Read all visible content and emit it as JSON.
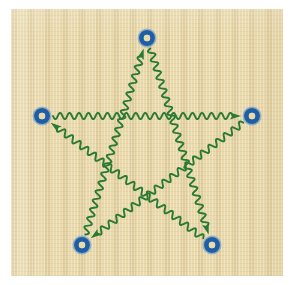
{
  "figure": {
    "panel": {
      "x": 11,
      "y": 9,
      "width": 272,
      "height": 267,
      "background_color": "#e9d9ab",
      "texture": "woven-paper"
    },
    "canvas": {
      "width": 293,
      "height": 285,
      "background_color": "#ffffff"
    }
  },
  "style": {
    "edge_color": "#2a7a33",
    "edge_width": 1.9,
    "node_ring_color": "#1d5ea6",
    "node_ring_highlight": "#4f90cf",
    "node_center_color": "#e9d9ab",
    "node_outer_radius": 8.0,
    "node_inner_radius": 3.2,
    "wave_amplitude": 3.2,
    "wave_period": 9.5,
    "arrow_length": 11,
    "arrow_width": 7
  },
  "nodes": [
    {
      "id": "top",
      "label": "top node",
      "x": 147,
      "y": 38
    },
    {
      "id": "right",
      "label": "right node",
      "x": 252,
      "y": 116
    },
    {
      "id": "bottom-right",
      "label": "bottom right node",
      "x": 212,
      "y": 245
    },
    {
      "id": "bottom-left",
      "label": "bottom left node",
      "x": 82,
      "y": 245
    },
    {
      "id": "left",
      "label": "left node",
      "x": 42,
      "y": 116
    }
  ],
  "edges": [
    {
      "id": "e1",
      "label": "left to right",
      "from": "left",
      "to": "right",
      "arrow_at": "to"
    },
    {
      "id": "e2",
      "label": "right to bottom-left",
      "from": "right",
      "to": "bottom-left",
      "arrow_at": "to"
    },
    {
      "id": "e3",
      "label": "bottom-left to top",
      "from": "bottom-left",
      "to": "top",
      "arrow_at": "to"
    },
    {
      "id": "e4",
      "label": "top to bottom-right",
      "from": "top",
      "to": "bottom-right",
      "arrow_at": "to"
    },
    {
      "id": "e5",
      "label": "bottom-right to left",
      "from": "bottom-right",
      "to": "left",
      "arrow_at": "to"
    }
  ]
}
